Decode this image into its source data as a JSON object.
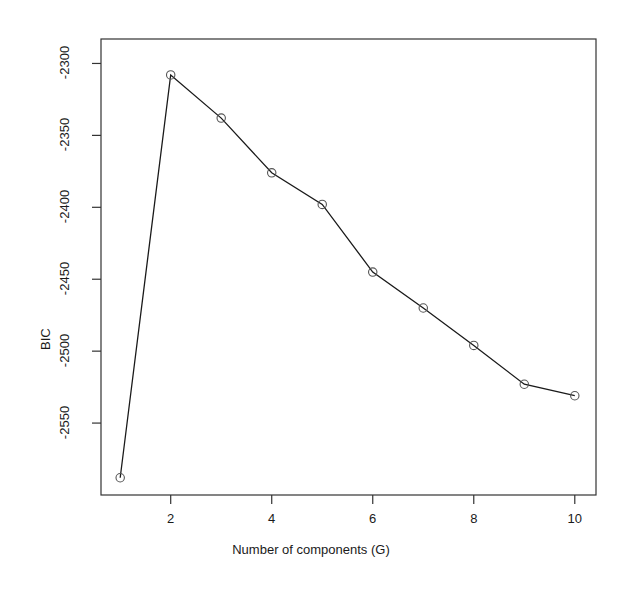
{
  "chart_data": {
    "type": "line",
    "title": "",
    "subtitle": "",
    "xlabel": "Number of components (G)",
    "ylabel": "BIC",
    "x": [
      1,
      2,
      3,
      4,
      5,
      6,
      7,
      8,
      9,
      10
    ],
    "values": [
      -2588,
      -2308,
      -2338,
      -2376,
      -2398,
      -2445,
      -2470,
      -2496,
      -2523,
      -2531
    ],
    "series": [
      {
        "name": "BIC",
        "values": [
          -2588,
          -2308,
          -2338,
          -2376,
          -2398,
          -2445,
          -2470,
          -2496,
          -2523,
          -2531
        ]
      }
    ],
    "xlim": [
      0.62,
      10.42
    ],
    "ylim": [
      -2600,
      -2283
    ],
    "xticks": [
      2,
      4,
      6,
      8,
      10
    ],
    "xtick_labels": [
      "2",
      "4",
      "6",
      "8",
      "10"
    ],
    "yticks": [
      -2300,
      -2350,
      -2400,
      -2450,
      -2500,
      -2550
    ],
    "ytick_labels": [
      "-2300",
      "-2350",
      "-2400",
      "-2450",
      "-2500",
      "-2550"
    ],
    "grid": false,
    "legend": null,
    "marker": "open-circle",
    "line_color": "#1a1a1a",
    "marker_color": "#555555",
    "background_color": "#ffffff",
    "box_color": "#333333"
  },
  "axes": {
    "x_title": "Number of components (G)",
    "y_title": "BIC"
  }
}
